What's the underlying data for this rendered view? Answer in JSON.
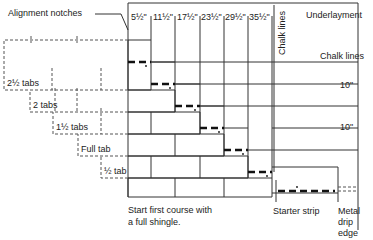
{
  "diagram": {
    "labels": {
      "alignment_notches": "Alignment notches",
      "underlayment": "Underlayment",
      "chalk_lines_vertical": "Chalk lines",
      "chalk_lines_horizontal": "Chalk lines",
      "exposure_1": "10\"",
      "exposure_2": "10\"",
      "starter_strip": "Starter strip",
      "metal_drip_edge_1": "Metal",
      "metal_drip_edge_2": "drip",
      "metal_drip_edge_3": "edge",
      "start_note_1": "Start first course with",
      "start_note_2": "a full shingle."
    },
    "column_offsets": [
      "5½\"",
      "11½\"",
      "17½\"",
      "23½\"",
      "29½\"",
      "35½\""
    ],
    "tab_cutoffs": [
      "2½ tabs",
      "2 tabs",
      "1½ tabs",
      "Full tab",
      "½ tab"
    ],
    "colors": {
      "line": "#333333",
      "dashed": "#555555",
      "background": "#ffffff"
    }
  }
}
